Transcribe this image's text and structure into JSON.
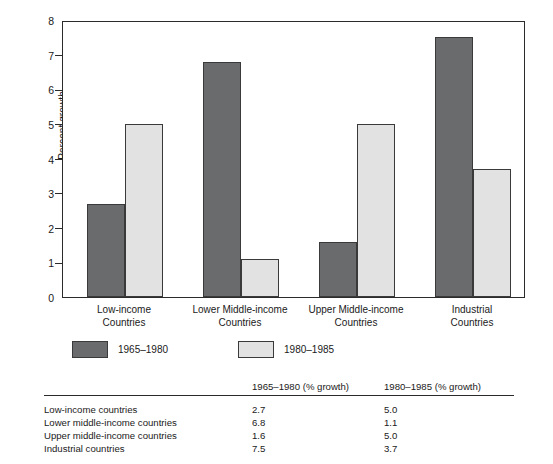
{
  "chart_data": {
    "type": "bar",
    "title": "",
    "xlabel": "",
    "ylabel": "Percent growth",
    "ylim": [
      0,
      8
    ],
    "ytick_labels": [
      "8",
      "7",
      "6",
      "5",
      "4",
      "3",
      "2",
      "1",
      "0"
    ],
    "ytick_values": [
      8,
      7,
      6,
      5,
      4,
      3,
      2,
      1,
      0
    ],
    "grid": false,
    "legend_position": "below-axes-left",
    "categories": [
      "Low-income\nCountries",
      "Lower Middle-income\nCountries",
      "Upper Middle-income\nCountries",
      "Industrial\nCountries"
    ],
    "category_lines": [
      [
        "Low-income",
        "Countries"
      ],
      [
        "Lower Middle-income",
        "Countries"
      ],
      [
        "Upper Middle-income",
        "Countries"
      ],
      [
        "Industrial",
        "Countries"
      ]
    ],
    "series": [
      {
        "name": "1965–1980",
        "color": "#6a6b6c",
        "values": [
          2.7,
          6.8,
          1.6,
          7.5
        ]
      },
      {
        "name": "1980–1985",
        "color": "#e2e2e2",
        "values": [
          5.0,
          1.1,
          5.0,
          3.7
        ]
      }
    ]
  },
  "legend": {
    "items": [
      {
        "label": "1965–1980",
        "color": "#6a6b6c"
      },
      {
        "label": "1980–1985",
        "color": "#e2e2e2"
      }
    ]
  },
  "table": {
    "headers": [
      "",
      "1965–1980 (% growth)",
      "1980–1985 (% growth)"
    ],
    "rows": [
      {
        "label": "Low-income countries",
        "v1": "2.7",
        "v2": "5.0"
      },
      {
        "label": "Lower middle-income countries",
        "v1": "6.8",
        "v2": "1.1"
      },
      {
        "label": "Upper middle-income countries",
        "v1": "1.6",
        "v2": "5.0"
      },
      {
        "label": "Industrial countries",
        "v1": "7.5",
        "v2": "3.7"
      }
    ]
  },
  "colors": {
    "series_a": "#6a6b6c",
    "series_b": "#e2e2e2",
    "axis": "#2b2b2b",
    "background": "#ffffff"
  }
}
